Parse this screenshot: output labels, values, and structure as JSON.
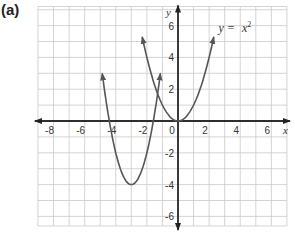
{
  "label": "(a)",
  "chart_data": {
    "type": "line",
    "title": "(a)",
    "xlabel": "x",
    "ylabel": "y",
    "xlim": [
      -9,
      7
    ],
    "ylim": [
      -6.6,
      7.2
    ],
    "grid": true,
    "x_ticks": [
      -8,
      -6,
      -4,
      -2,
      0,
      2,
      4,
      6
    ],
    "y_ticks": [
      -6,
      -4,
      -2,
      2,
      4,
      6
    ],
    "x_tick_labels": [
      "-8",
      "-6",
      "-4",
      "-2",
      "0",
      "2",
      "4",
      "6"
    ],
    "y_tick_labels": [
      "-6",
      "-4",
      "-2",
      "2",
      "4",
      "6"
    ],
    "series": [
      {
        "name": "y = x²",
        "equation": "y = x^2",
        "x_range": [
          -2.3,
          2.3
        ],
        "vertex": [
          0,
          0
        ],
        "points": [
          [
            -2.3,
            5.29
          ],
          [
            -2,
            4
          ],
          [
            -1,
            1
          ],
          [
            0,
            0
          ],
          [
            1,
            1
          ],
          [
            2,
            4
          ],
          [
            2.3,
            5.29
          ]
        ]
      },
      {
        "name": "translated parabola",
        "equation": "y = 2(x + 3)^2 - 4",
        "x_range": [
          -4.87,
          -1.13
        ],
        "vertex": [
          -3,
          -4
        ],
        "points": [
          [
            -4.87,
            3
          ],
          [
            -4.41,
            0
          ],
          [
            -4,
            -2
          ],
          [
            -3,
            -4
          ],
          [
            -2,
            -2
          ],
          [
            -1.59,
            0
          ],
          [
            -1.13,
            3
          ]
        ]
      }
    ],
    "annotations": [
      {
        "text": "y =  x²",
        "x": 2.6,
        "y": 5.6
      }
    ]
  },
  "annotation": {
    "prefix": "y = ",
    "base": "x",
    "exp": "2"
  },
  "axes": {
    "x_name": "x",
    "y_name": "y"
  }
}
